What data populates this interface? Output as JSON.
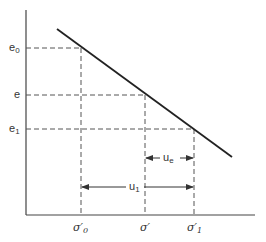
{
  "diagram": {
    "type": "e-log-sigma consolidation relationship",
    "y_labels": [
      {
        "base": "e",
        "sub": "0",
        "y": 48
      },
      {
        "base": "e",
        "sub": "",
        "y": 95
      },
      {
        "base": "e",
        "sub": "1",
        "y": 129
      }
    ],
    "x_labels": [
      {
        "base": "σ′",
        "sub": "0",
        "x": 81
      },
      {
        "base": "σ′",
        "sub": "",
        "x": 145
      },
      {
        "base": "σ′",
        "sub": "1",
        "x": 194
      }
    ],
    "line": {
      "x1": 57,
      "y1": 29,
      "x2": 232,
      "y2": 157
    },
    "dimensions": [
      {
        "label_base": "u",
        "label_sub": "e",
        "from_x": 145,
        "to_x": 194,
        "y": 158
      },
      {
        "label_base": "u",
        "label_sub": "1",
        "from_x": 81,
        "to_x": 194,
        "y": 187
      }
    ],
    "colors": {
      "line": "#222222",
      "dash": "#555555",
      "axis": "#444444"
    }
  }
}
